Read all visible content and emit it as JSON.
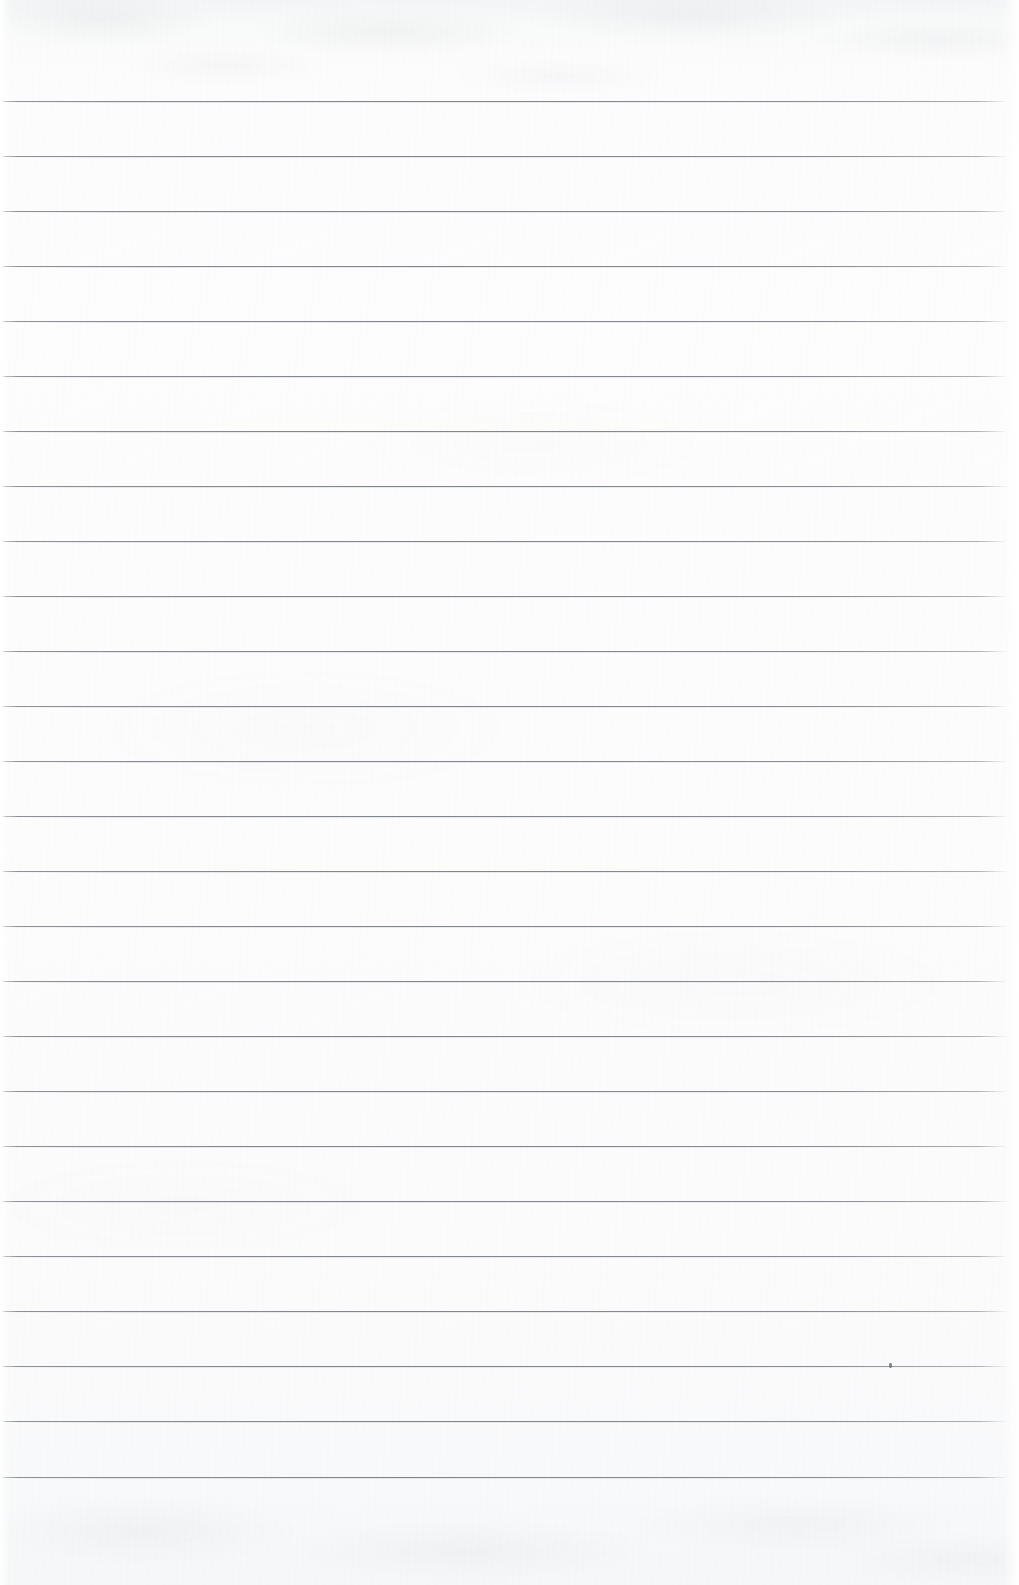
{
  "document": {
    "kind": "lined-paper-scan",
    "title": "Blank ruled notebook page",
    "content_text": "",
    "visible_text": "",
    "page_width": 1019,
    "page_height": 1585
  },
  "paper": {
    "background_color": "#fbfbfc",
    "top_edge_tint": "#f4f5f6",
    "bottom_edge_tint": "#f6f7f8"
  },
  "ruling": {
    "line_color": "#84888e",
    "line_count": 26,
    "first_line_y": 101,
    "line_spacing": 55,
    "line_thickness": 1,
    "line_start_x": 2,
    "line_end_x": 1008,
    "top_margin": 101,
    "bottom_margin": 108,
    "lines_y": [
      101,
      156,
      211,
      266,
      321,
      376,
      431,
      486,
      541,
      596,
      651,
      706,
      761,
      816,
      871,
      926,
      981,
      1036,
      1091,
      1146,
      1201,
      1256,
      1311,
      1366,
      1421,
      1477
    ]
  },
  "artifacts": [
    {
      "name": "ink-speck",
      "x": 889,
      "y": 1363
    }
  ]
}
